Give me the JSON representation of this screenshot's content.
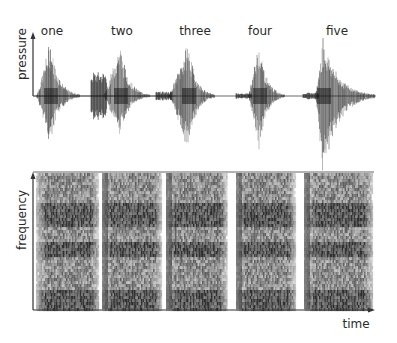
{
  "figure": {
    "words": [
      {
        "label": "one",
        "wave_peak_up": 0.95,
        "wave_peak_down": 0.85,
        "pre_burst": 0.0
      },
      {
        "label": "two",
        "wave_peak_up": 0.9,
        "wave_peak_down": 0.7,
        "pre_burst": 0.45
      },
      {
        "label": "three",
        "wave_peak_up": 0.92,
        "wave_peak_down": 0.95,
        "pre_burst": 0.08
      },
      {
        "label": "four",
        "wave_peak_up": 0.95,
        "wave_peak_down": 0.9,
        "pre_burst": 0.05
      },
      {
        "label": "five",
        "wave_peak_up": 1.0,
        "wave_peak_down": 1.35,
        "pre_burst": 0.06
      }
    ],
    "top_panel": {
      "ylabel": "pressure"
    },
    "bottom_panel": {
      "ylabel": "frequency",
      "xlabel": "time"
    },
    "colors": {
      "ink": "#1e1e1e",
      "axis": "#333333",
      "background": "#ffffff"
    }
  }
}
